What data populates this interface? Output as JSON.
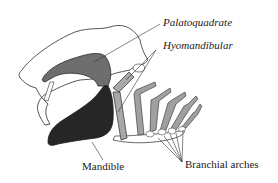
{
  "diagram": {
    "labels": {
      "palatoquadrate": "Palatoquadrate",
      "hyomandibular": "Hyomandibular",
      "mandible": "Mandible",
      "branchial_arches": "Branchial arches"
    },
    "colors": {
      "outline": "#2a2a2a",
      "cranium_fill": "#ffffff",
      "palatoquadrate_fill": "#6e6e6e",
      "mandible_fill": "#262626",
      "hyoid_fill": "#a8a8a8",
      "arch_fill": "#a0a0a0",
      "leader_line": "#333333"
    }
  }
}
